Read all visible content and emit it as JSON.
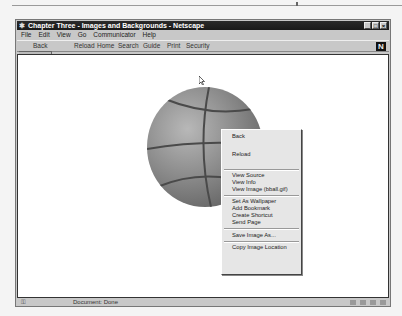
{
  "window": {
    "title": "Chapter Three - Images and Backgrounds - Netscape",
    "buttons": [
      "minimize",
      "maximize",
      "close"
    ],
    "button_glyphs": [
      "_",
      "□",
      "×"
    ]
  },
  "menubar": {
    "items": [
      "File",
      "Edit",
      "View",
      "Go",
      "Communicator",
      "Help"
    ]
  },
  "toolbar": {
    "buttons": [
      {
        "label": "Back",
        "enabled": true
      },
      {
        "label": "Forward",
        "enabled": false
      },
      {
        "label": "Reload",
        "enabled": true
      },
      {
        "label": "Home",
        "enabled": true
      },
      {
        "label": "Search",
        "enabled": true
      },
      {
        "label": "Guide",
        "enabled": true
      },
      {
        "label": "Print",
        "enabled": true
      },
      {
        "label": "Security",
        "enabled": true
      },
      {
        "label": "Stop",
        "enabled": false
      }
    ],
    "logo": "N"
  },
  "content": {
    "image": "basketball"
  },
  "context_menu": {
    "items": [
      {
        "label": "Back",
        "enabled": true
      },
      {
        "label": "",
        "enabled": false
      },
      {
        "label": "Reload",
        "enabled": true
      },
      {
        "label": "",
        "enabled": false
      },
      {
        "type": "separator"
      },
      {
        "label": "View Source",
        "enabled": true
      },
      {
        "label": "View Info",
        "enabled": true
      },
      {
        "label": "View Image (bball.gif)",
        "enabled": true
      },
      {
        "type": "separator"
      },
      {
        "label": "Set As Wallpaper",
        "enabled": true
      },
      {
        "label": "Add Bookmark",
        "enabled": true
      },
      {
        "label": "Create Shortcut",
        "enabled": true
      },
      {
        "label": "Send Page",
        "enabled": true
      },
      {
        "type": "separator"
      },
      {
        "label": "Save Image As...",
        "enabled": true
      },
      {
        "type": "separator"
      },
      {
        "label": "Copy Image Location",
        "enabled": true
      }
    ]
  },
  "statusbar": {
    "text": "Document: Done"
  },
  "colors": {
    "titlebar": "#1a1a1a",
    "chrome": "#c8c8c8",
    "content_bg": "#ffffff",
    "ball": "#8a8a8a"
  }
}
